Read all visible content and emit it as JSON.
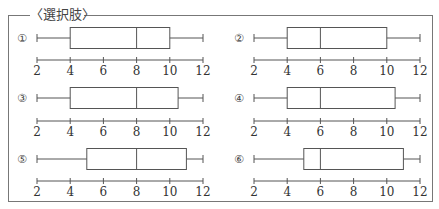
{
  "title": "〈選択肢〉",
  "colors": {
    "line": "#555555",
    "frame": "#777777",
    "text": "#333333"
  },
  "chart_data": [
    {
      "type": "box",
      "label": "①",
      "min": 2,
      "q1": 4,
      "median": 8,
      "q3": 10,
      "max": 12,
      "xticks": [
        2,
        4,
        6,
        8,
        10,
        12
      ],
      "xlim": [
        2,
        12
      ]
    },
    {
      "type": "box",
      "label": "②",
      "min": 2,
      "q1": 4,
      "median": 6,
      "q3": 10,
      "max": 12,
      "xticks": [
        2,
        4,
        6,
        8,
        10,
        12
      ],
      "xlim": [
        2,
        12
      ]
    },
    {
      "type": "box",
      "label": "③",
      "min": 2,
      "q1": 4,
      "median": 8,
      "q3": 10.5,
      "max": 12,
      "xticks": [
        2,
        4,
        6,
        8,
        10,
        12
      ],
      "xlim": [
        2,
        12
      ]
    },
    {
      "type": "box",
      "label": "④",
      "min": 2,
      "q1": 4,
      "median": 6,
      "q3": 10.5,
      "max": 12,
      "xticks": [
        2,
        4,
        6,
        8,
        10,
        12
      ],
      "xlim": [
        2,
        12
      ]
    },
    {
      "type": "box",
      "label": "⑤",
      "min": 2,
      "q1": 5,
      "median": 8,
      "q3": 11,
      "max": 12,
      "xticks": [
        2,
        4,
        6,
        8,
        10,
        12
      ],
      "xlim": [
        2,
        12
      ]
    },
    {
      "type": "box",
      "label": "⑥",
      "min": 2,
      "q1": 5,
      "median": 6,
      "q3": 11,
      "max": 12,
      "xticks": [
        2,
        4,
        6,
        8,
        10,
        12
      ],
      "xlim": [
        2,
        12
      ]
    }
  ]
}
